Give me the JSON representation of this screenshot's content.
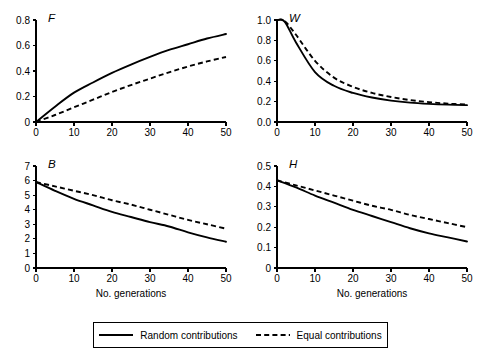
{
  "figure": {
    "panels_order": [
      "F",
      "W",
      "B",
      "H"
    ]
  },
  "legend": {
    "entries": [
      {
        "label": "Random contributions",
        "style": "solid",
        "swatch_name": "solid-line-swatch"
      },
      {
        "label": "Equal contributions",
        "style": "dashed",
        "swatch_name": "dashed-line-swatch"
      }
    ]
  },
  "chart_data": [
    {
      "type": "line",
      "title": "F",
      "panel_letter": "F",
      "xlabel": "",
      "ylabel": "",
      "xlim": [
        0,
        50
      ],
      "ylim": [
        0,
        0.8
      ],
      "xticks": [
        0,
        10,
        20,
        30,
        40,
        50
      ],
      "yticks": [
        0,
        0.2,
        0.4,
        0.6,
        0.8
      ],
      "xticklabels": [
        "0",
        "10",
        "20",
        "30",
        "40",
        "50"
      ],
      "yticklabels": [
        "0",
        "0.2",
        "0.4",
        "0.6",
        "0.8"
      ],
      "grid": false,
      "x": [
        0,
        5,
        10,
        15,
        20,
        25,
        30,
        35,
        40,
        45,
        50
      ],
      "series": [
        {
          "name": "Random contributions",
          "style": "solid",
          "values": [
            0.0,
            0.12,
            0.23,
            0.31,
            0.385,
            0.45,
            0.51,
            0.565,
            0.61,
            0.655,
            0.69
          ]
        },
        {
          "name": "Equal contributions",
          "style": "dashed",
          "values": [
            0.0,
            0.055,
            0.115,
            0.175,
            0.235,
            0.29,
            0.34,
            0.39,
            0.435,
            0.475,
            0.51
          ]
        }
      ]
    },
    {
      "type": "line",
      "title": "W",
      "panel_letter": "W",
      "xlabel": "",
      "ylabel": "",
      "xlim": [
        0,
        50
      ],
      "ylim": [
        0,
        1.0
      ],
      "xticks": [
        0,
        10,
        20,
        30,
        40,
        50
      ],
      "yticks": [
        0,
        0.2,
        0.4,
        0.6,
        0.8,
        1.0
      ],
      "xticklabels": [
        "0",
        "10",
        "20",
        "30",
        "40",
        "50"
      ],
      "yticklabels": [
        "0.0",
        "0.2",
        "0.4",
        "0.6",
        "0.8",
        "1.0"
      ],
      "grid": false,
      "x": [
        0,
        2,
        5,
        10,
        15,
        20,
        25,
        30,
        35,
        40,
        45,
        50
      ],
      "series": [
        {
          "name": "Random contributions",
          "style": "solid",
          "values": [
            1.0,
            0.985,
            0.78,
            0.49,
            0.355,
            0.285,
            0.24,
            0.21,
            0.19,
            0.178,
            0.17,
            0.165
          ]
        },
        {
          "name": "Equal contributions",
          "style": "dashed",
          "values": [
            1.0,
            0.99,
            0.855,
            0.6,
            0.435,
            0.345,
            0.285,
            0.245,
            0.215,
            0.195,
            0.18,
            0.17
          ]
        }
      ]
    },
    {
      "type": "line",
      "title": "B",
      "panel_letter": "B",
      "xlabel": "No. generations",
      "ylabel": "",
      "xlim": [
        0,
        50
      ],
      "ylim": [
        0,
        7
      ],
      "xticks": [
        0,
        10,
        20,
        30,
        40,
        50
      ],
      "yticks": [
        0,
        1,
        2,
        3,
        4,
        5,
        6,
        7
      ],
      "xticklabels": [
        "0",
        "10",
        "20",
        "30",
        "40",
        "50"
      ],
      "yticklabels": [
        "0",
        "1",
        "2",
        "3",
        "4",
        "5",
        "6",
        "7"
      ],
      "grid": false,
      "x": [
        0,
        5,
        10,
        15,
        20,
        25,
        30,
        35,
        40,
        45,
        50
      ],
      "series": [
        {
          "name": "Random contributions",
          "style": "solid",
          "values": [
            5.9,
            5.3,
            4.75,
            4.3,
            3.85,
            3.5,
            3.15,
            2.85,
            2.45,
            2.1,
            1.8
          ]
        },
        {
          "name": "Equal contributions",
          "style": "dashed",
          "values": [
            5.9,
            5.6,
            5.3,
            5.0,
            4.65,
            4.35,
            4.0,
            3.65,
            3.3,
            3.0,
            2.7
          ]
        }
      ]
    },
    {
      "type": "line",
      "title": "H",
      "panel_letter": "H",
      "xlabel": "No. generations",
      "ylabel": "",
      "xlim": [
        0,
        50
      ],
      "ylim": [
        0,
        0.5
      ],
      "xticks": [
        0,
        10,
        20,
        30,
        40,
        50
      ],
      "yticks": [
        0,
        0.1,
        0.2,
        0.3,
        0.4,
        0.5
      ],
      "xticklabels": [
        "0",
        "10",
        "20",
        "30",
        "40",
        "50"
      ],
      "yticklabels": [
        "0",
        "0.1",
        "0.2",
        "0.3",
        "0.4",
        "0.5"
      ],
      "grid": false,
      "x": [
        0,
        5,
        10,
        15,
        20,
        25,
        30,
        35,
        40,
        45,
        50
      ],
      "series": [
        {
          "name": "Random contributions",
          "style": "solid",
          "values": [
            0.43,
            0.395,
            0.355,
            0.32,
            0.285,
            0.255,
            0.225,
            0.195,
            0.17,
            0.15,
            0.13
          ]
        },
        {
          "name": "Equal contributions",
          "style": "dashed",
          "values": [
            0.43,
            0.405,
            0.38,
            0.355,
            0.33,
            0.305,
            0.285,
            0.26,
            0.24,
            0.22,
            0.2
          ]
        }
      ]
    }
  ]
}
